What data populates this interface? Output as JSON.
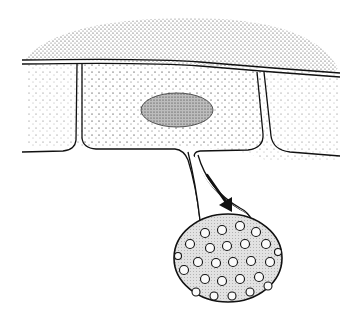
{
  "figure": {
    "colors": {
      "background": "#ffffff",
      "ink": "#111111",
      "stipple_dense": "#555555",
      "stipple_light": "#9a9a9a",
      "body_fill": "#dcdcdc"
    },
    "elements": {
      "cuticle_layer": "stippled-upper-layer",
      "cells": [
        "left-cell",
        "center-cell",
        "right-cell"
      ],
      "nucleus": "nucleus",
      "tube": "germ-tube",
      "arrow": "arrow-icon",
      "body": "ornamented-spore"
    }
  }
}
